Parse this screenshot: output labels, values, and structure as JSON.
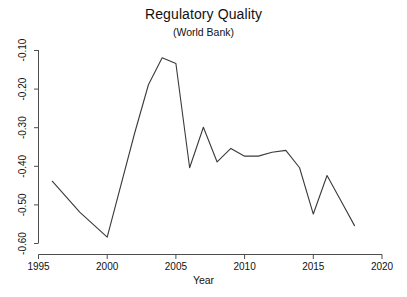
{
  "chart_data": {
    "type": "line",
    "title": "Regulatory Quality",
    "subtitle": "(World Bank)",
    "xlabel": "Year",
    "ylabel": "",
    "grid": false,
    "legend": false,
    "xlim": [
      1995,
      2020
    ],
    "ylim": [
      -0.6,
      -0.1
    ],
    "xticks": [
      "1995",
      "2000",
      "2005",
      "2010",
      "2015",
      "2020"
    ],
    "yticks": [
      "-0.60",
      "-0.50",
      "-0.40",
      "-0.30",
      "-0.20",
      "-0.10"
    ],
    "line_color": "#3a3a3a",
    "x": [
      1996,
      1997,
      1998,
      2000,
      2002,
      2003,
      2004,
      2005,
      2006,
      2007,
      2008,
      2009,
      2010,
      2011,
      2012,
      2013,
      2014,
      2015,
      2016,
      2017,
      2018
    ],
    "values": [
      -0.44,
      -0.48,
      -0.52,
      -0.585,
      -0.315,
      -0.19,
      -0.12,
      -0.135,
      -0.405,
      -0.3,
      -0.39,
      -0.355,
      -0.375,
      -0.375,
      -0.365,
      -0.36,
      -0.405,
      -0.525,
      -0.425,
      -0.49,
      -0.555
    ],
    "series": [
      {
        "name": "Regulatory Quality",
        "points": [
          {
            "year": 1996,
            "value": -0.44
          },
          {
            "year": 1997,
            "value": -0.48
          },
          {
            "year": 1998,
            "value": -0.52
          },
          {
            "year": 2000,
            "value": -0.585
          },
          {
            "year": 2002,
            "value": -0.315
          },
          {
            "year": 2003,
            "value": -0.19
          },
          {
            "year": 2004,
            "value": -0.12
          },
          {
            "year": 2005,
            "value": -0.135
          },
          {
            "year": 2006,
            "value": -0.405
          },
          {
            "year": 2007,
            "value": -0.3
          },
          {
            "year": 2008,
            "value": -0.39
          },
          {
            "year": 2009,
            "value": -0.355
          },
          {
            "year": 2010,
            "value": -0.375
          },
          {
            "year": 2011,
            "value": -0.375
          },
          {
            "year": 2012,
            "value": -0.365
          },
          {
            "year": 2013,
            "value": -0.36
          },
          {
            "year": 2014,
            "value": -0.405
          },
          {
            "year": 2015,
            "value": -0.525
          },
          {
            "year": 2016,
            "value": -0.425
          },
          {
            "year": 2017,
            "value": -0.49
          },
          {
            "year": 2018,
            "value": -0.555
          }
        ]
      }
    ]
  }
}
